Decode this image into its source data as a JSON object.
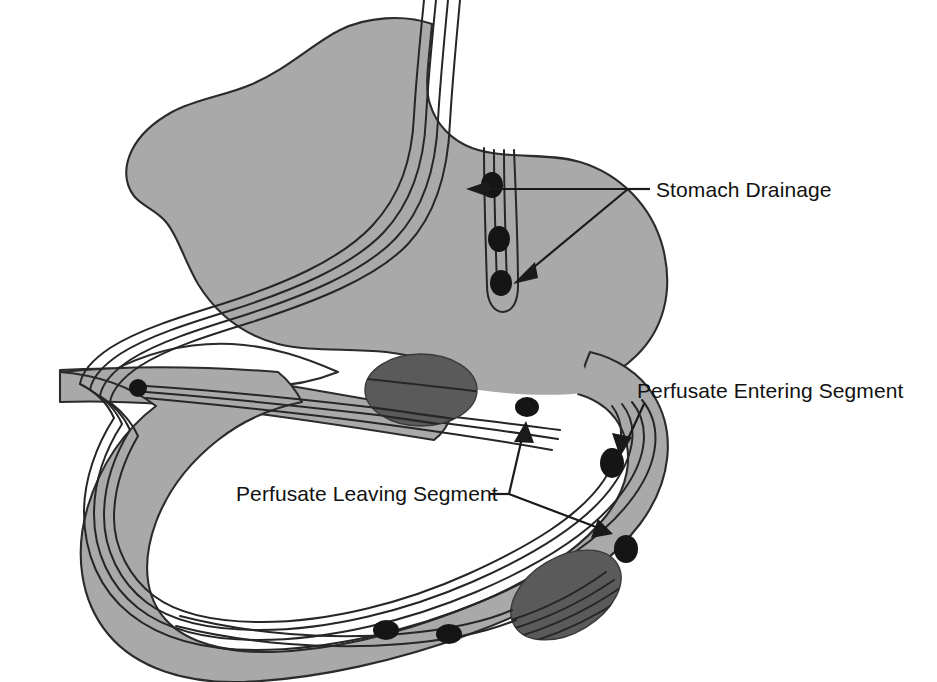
{
  "figure": {
    "background_color": "#ffffff",
    "organ_fill_color": "#a9a9a9",
    "outline_color": "#2b2b2b",
    "clamp_color": "#5a5a5a",
    "node_color": "#151515"
  },
  "labels": {
    "stomach_drainage": "Stomach Drainage",
    "perfusate_entering": "Perfusate Entering Segment",
    "perfusate_leaving": "Perfusate Leaving Segment"
  },
  "annotations": [
    {
      "id": "stomach-drainage",
      "label": "Stomach Drainage",
      "text_x": 648,
      "text_y": 196,
      "vertex_x": 628,
      "vertex_y": 189,
      "arrow_count": 2,
      "targets": [
        {
          "x": 468,
          "y": 189
        },
        {
          "x": 512,
          "y": 276
        }
      ]
    },
    {
      "id": "perfusate-entering",
      "label": "Perfusate Entering Segment",
      "text_x": 637,
      "text_y": 398,
      "vertex_x": 642,
      "vertex_y": 404,
      "arrow_count": 1,
      "targets": [
        {
          "x": 623,
          "y": 452
        }
      ]
    },
    {
      "id": "perfusate-leaving",
      "label": "Perfusate Leaving Segment",
      "text_x": 236,
      "text_y": 500,
      "vertex_x": 509,
      "vertex_y": 494,
      "arrow_count": 2,
      "targets": [
        {
          "x": 524,
          "y": 424
        },
        {
          "x": 610,
          "y": 536
        }
      ]
    }
  ],
  "clamps": [
    {
      "id": "clamp-upper",
      "cx": 421,
      "cy": 390,
      "rx": 56,
      "ry": 36,
      "rotation": 0
    },
    {
      "id": "clamp-lower",
      "cx": 566,
      "cy": 595,
      "rx": 60,
      "ry": 38,
      "rotation": -31
    }
  ],
  "nodes": [
    {
      "id": "node-drain-1",
      "cx": 492,
      "cy": 185,
      "r": 10
    },
    {
      "id": "node-drain-2",
      "cx": 498,
      "cy": 239,
      "r": 10
    },
    {
      "id": "node-drain-3",
      "cx": 500,
      "cy": 283,
      "r": 10
    },
    {
      "id": "node-left-limb",
      "cx": 138,
      "cy": 388,
      "r": 9
    },
    {
      "id": "node-entering-1",
      "cx": 527,
      "cy": 407,
      "r": 10
    },
    {
      "id": "node-entering-2",
      "cx": 613,
      "cy": 463,
      "r": 11
    },
    {
      "id": "node-entering-3",
      "cx": 627,
      "cy": 549,
      "r": 11
    },
    {
      "id": "node-bottom-1",
      "cx": 386,
      "cy": 630,
      "r": 10
    },
    {
      "id": "node-bottom-2",
      "cx": 448,
      "cy": 634,
      "r": 10
    }
  ],
  "structures": [
    {
      "id": "stomach-body",
      "name": "stomach"
    },
    {
      "id": "drainage-tube",
      "name": "stomach drainage tube"
    },
    {
      "id": "intestinal-loop",
      "name": "intestinal perfusion loop"
    },
    {
      "id": "catheter-bundle",
      "name": "catheter line bundle"
    }
  ]
}
